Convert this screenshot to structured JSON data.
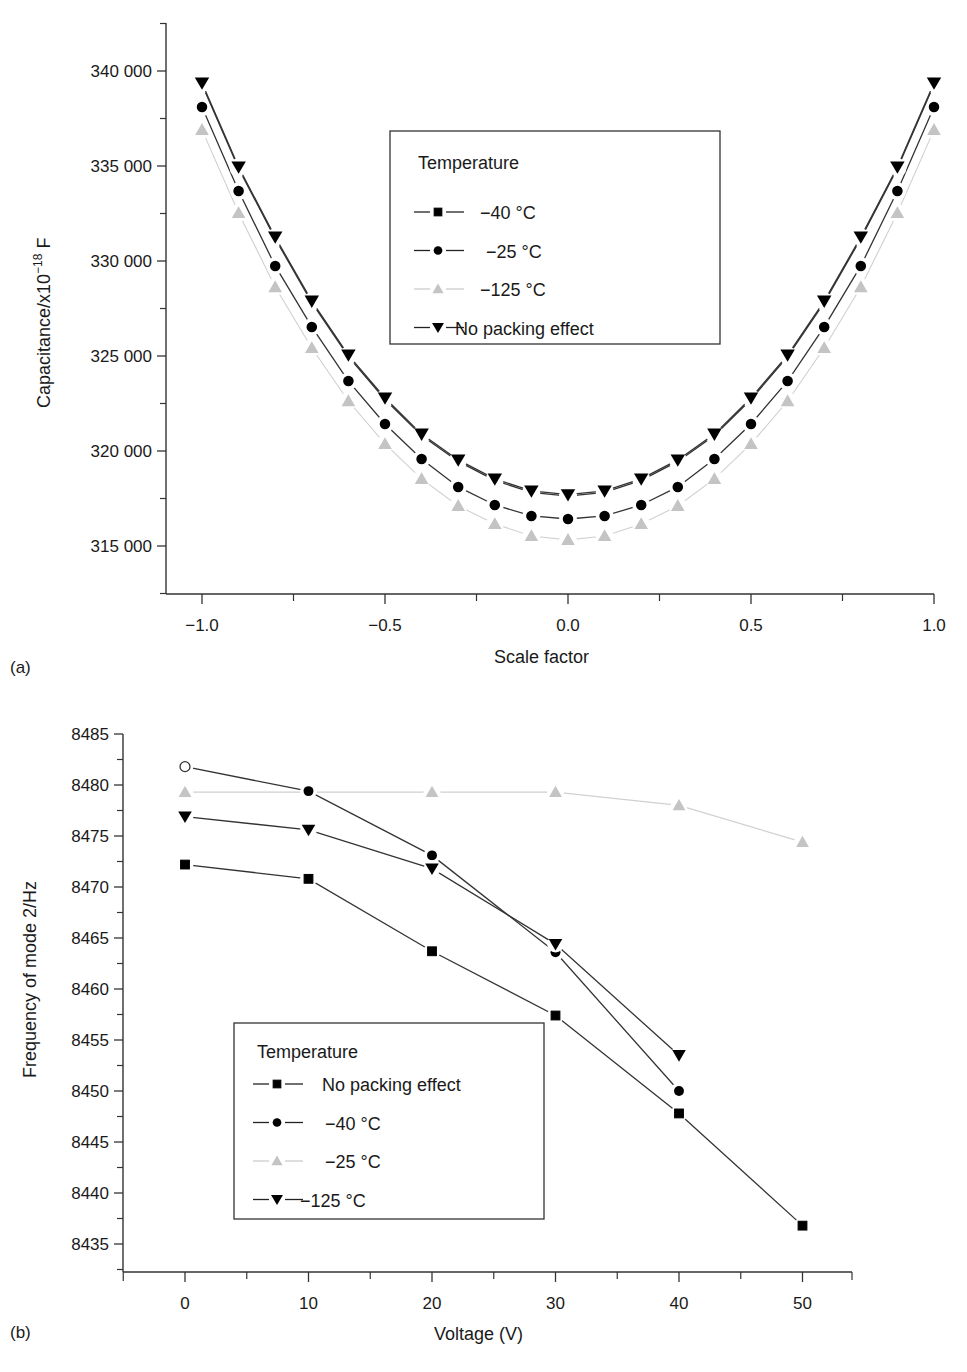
{
  "chart_data": [
    {
      "panel": "(a)",
      "type": "line",
      "title": "",
      "xlabel": "Scale factor",
      "ylabel": "Capacitance/x10⁻¹⁸ F",
      "xlim": [
        -1.1,
        1.0
      ],
      "ylim": [
        312500,
        342500
      ],
      "xticks": [
        -1.0,
        -0.5,
        0.0,
        0.5,
        1.0
      ],
      "xtick_labels": [
        "−1.0",
        "−0.5",
        "0.0",
        "0.5",
        "1.0"
      ],
      "yticks": [
        315000,
        320000,
        325000,
        330000,
        335000,
        340000
      ],
      "ytick_labels": [
        "315 000",
        "320 000",
        "325 000",
        "330 000",
        "335 000",
        "340 000"
      ],
      "grid": false,
      "legend_title": "Temperature",
      "legend_position": "upper center",
      "x": [
        -1.0,
        -0.9,
        -0.8,
        -0.7,
        -0.6,
        -0.5,
        -0.4,
        -0.3,
        -0.2,
        -0.1,
        0.0,
        0.1,
        0.2,
        0.3,
        0.4,
        0.5,
        0.6,
        0.7,
        0.8,
        0.9,
        1.0
      ],
      "series": [
        {
          "name": "−40 °C",
          "marker": "square",
          "color": "#000000",
          "values": [
            339290,
            334870,
            331180,
            327810,
            324970,
            322710,
            320810,
            319450,
            318450,
            317820,
            317620,
            317820,
            318450,
            319450,
            320810,
            322710,
            324970,
            327810,
            331180,
            334870,
            339290
          ]
        },
        {
          "name": "−25 °C",
          "marker": "circle",
          "color": "#000000",
          "values": [
            338100,
            333680,
            329740,
            326530,
            323680,
            321420,
            319580,
            318110,
            317160,
            316580,
            316420,
            316580,
            317160,
            318110,
            319580,
            321420,
            323680,
            326530,
            329740,
            333680,
            338100
          ]
        },
        {
          "name": "−125 °C",
          "marker": "triangle-up",
          "color": "#c8c8c8",
          "values": [
            336900,
            332530,
            328630,
            325420,
            322630,
            320370,
            318530,
            317110,
            316160,
            315530,
            315320,
            315530,
            316160,
            317110,
            318530,
            320370,
            322630,
            325420,
            328630,
            332530,
            336900
          ]
        },
        {
          "name": "No packing effect",
          "marker": "triangle-down",
          "color": "#000000",
          "values": [
            339370,
            334950,
            331260,
            327890,
            325050,
            322790,
            320890,
            319530,
            318530,
            317900,
            317700,
            317900,
            318530,
            319530,
            320890,
            322790,
            325050,
            327890,
            331260,
            334950,
            339370
          ]
        }
      ]
    },
    {
      "panel": "(b)",
      "type": "line",
      "title": "",
      "xlabel": "Voltage (V)",
      "ylabel": "Frequency of mode 2/Hz",
      "xlim": [
        -5,
        55
      ],
      "ylim": [
        8432.5,
        8487.5
      ],
      "xticks": [
        0,
        10,
        20,
        30,
        40,
        50
      ],
      "xtick_labels": [
        "0",
        "10",
        "20",
        "30",
        "40",
        "50"
      ],
      "yticks": [
        8435,
        8440,
        8445,
        8450,
        8455,
        8460,
        8465,
        8470,
        8475,
        8480,
        8485
      ],
      "ytick_labels": [
        "8435",
        "8440",
        "8445",
        "8450",
        "8455",
        "8460",
        "8465",
        "8470",
        "8475",
        "8480",
        "8485"
      ],
      "grid": false,
      "legend_title": "Temperature",
      "legend_position": "lower left",
      "series": [
        {
          "name": "No packing effect",
          "marker": "square",
          "color": "#000000",
          "x": [
            0,
            10,
            20,
            30,
            40,
            50
          ],
          "values": [
            8472.2,
            8470.8,
            8463.7,
            8457.4,
            8447.8,
            8436.8
          ]
        },
        {
          "name": "−40 °C",
          "marker": "circle",
          "color": "#000000",
          "x": [
            0,
            10,
            20,
            30,
            40
          ],
          "values": [
            8481.8,
            8479.4,
            8473.1,
            8463.6,
            8450.0
          ],
          "note": "point at 0 V drawn as open circle"
        },
        {
          "name": "−25 °C",
          "marker": "triangle-up",
          "color": "#c8c8c8",
          "x": [
            0,
            10,
            20,
            30,
            40,
            50
          ],
          "values": [
            8479.3,
            8479.3,
            8479.3,
            8479.3,
            8478.0,
            8474.4
          ]
        },
        {
          "name": "−125 °C",
          "marker": "triangle-down",
          "color": "#000000",
          "x": [
            0,
            10,
            20,
            30,
            40
          ],
          "values": [
            8476.9,
            8475.6,
            8471.8,
            8464.4,
            8453.5
          ]
        }
      ]
    }
  ],
  "labels": {
    "panel_a": "(a)",
    "panel_b": "(b)",
    "a_xlabel": "Scale factor",
    "a_ylabel_main": "Capacitance/x10",
    "a_ylabel_sup": "−18",
    "a_ylabel_unit": " F",
    "b_xlabel": "Voltage (V)",
    "b_ylabel": "Frequency of mode 2/Hz",
    "legend_title_a": "Temperature",
    "legend_title_b": "Temperature"
  }
}
